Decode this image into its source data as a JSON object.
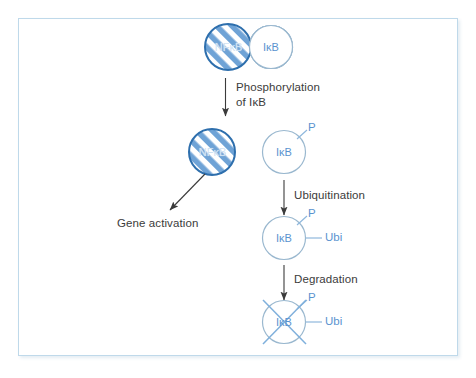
{
  "figure": {
    "border_color": "#bfd9ea",
    "accent_color": "#5a93cf",
    "text_color": "#3b3b3b"
  },
  "nodes": {
    "complex_nfkb": {
      "label": "NFκB",
      "style": "striped-circle"
    },
    "complex_ikb": {
      "label": "IκB",
      "style": "open-circle"
    },
    "free_nfkb": {
      "label": "NFκB",
      "style": "striped-circle"
    },
    "ikb_p": {
      "label": "IκB",
      "style": "open-circle"
    },
    "ikb_p_ubi": {
      "label": "IκB",
      "style": "open-circle"
    },
    "ikb_degraded": {
      "label": "IκB",
      "style": "open-circle-crossed"
    }
  },
  "marks": {
    "phosphate_1": "P",
    "phosphate_2": "P",
    "phosphate_3": "P",
    "ubiquitin_1": "Ubi",
    "ubiquitin_2": "Ubi"
  },
  "steps": [
    {
      "id": "phosphorylation",
      "line1": "Phosphorylation",
      "line2": "of IκB"
    },
    {
      "id": "ubiquitination",
      "line1": "Ubiquitination",
      "line2": ""
    },
    {
      "id": "degradation",
      "line1": "Degradation",
      "line2": ""
    }
  ],
  "outcomes": [
    {
      "id": "gene-activation",
      "label": "Gene activation"
    }
  ]
}
